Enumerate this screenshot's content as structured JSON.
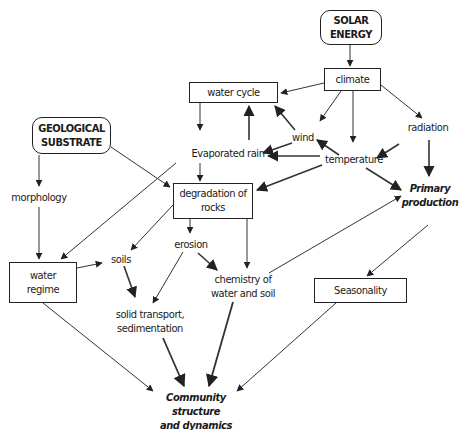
{
  "diagram": {
    "nodes": {
      "solar_energy": {
        "line1": "SOLAR",
        "line2": "ENERGY"
      },
      "climate": {
        "label": "climate"
      },
      "water_cycle": {
        "label": "water cycle"
      },
      "wind": {
        "label": "wind"
      },
      "radiation": {
        "label": "radiation"
      },
      "evaporated_rain": {
        "label": "Evaporated rain"
      },
      "temperature": {
        "label": "temperature"
      },
      "geological_substrate": {
        "line1": "GEOLOGICAL",
        "line2": "SUBSTRATE"
      },
      "morphology": {
        "label": "morphology"
      },
      "degradation_of_rocks": {
        "line1": "degradation of",
        "line2": "rocks"
      },
      "primary_production": {
        "line1": "Primary",
        "line2": "production"
      },
      "erosion": {
        "label": "erosion"
      },
      "soils": {
        "label": "soils"
      },
      "water_regime": {
        "line1": "water",
        "line2": "regime"
      },
      "chemistry": {
        "line1": "chemistry of",
        "line2": "water and soil"
      },
      "seasonality": {
        "label": "Seasonality"
      },
      "solid_transport": {
        "line1": "solid transport,",
        "line2": "sedimentation"
      },
      "community": {
        "line1": "Community structure",
        "line2": "and dynamics"
      }
    },
    "edges": [
      [
        "solar_energy",
        "climate"
      ],
      [
        "climate",
        "water_cycle"
      ],
      [
        "climate",
        "wind"
      ],
      [
        "climate",
        "temperature"
      ],
      [
        "climate",
        "radiation"
      ],
      [
        "water_cycle",
        "evaporated_rain"
      ],
      [
        "evaporated_rain",
        "water_cycle"
      ],
      [
        "wind",
        "water_cycle"
      ],
      [
        "wind",
        "evaporated_rain"
      ],
      [
        "temperature",
        "wind"
      ],
      [
        "temperature",
        "evaporated_rain"
      ],
      [
        "temperature",
        "degradation_of_rocks"
      ],
      [
        "temperature",
        "primary_production"
      ],
      [
        "radiation",
        "temperature"
      ],
      [
        "radiation",
        "primary_production"
      ],
      [
        "geological_substrate",
        "morphology"
      ],
      [
        "geological_substrate",
        "degradation_of_rocks"
      ],
      [
        "evaporated_rain",
        "degradation_of_rocks"
      ],
      [
        "evaporated_rain",
        "water_regime"
      ],
      [
        "morphology",
        "water_regime"
      ],
      [
        "degradation_of_rocks",
        "soils"
      ],
      [
        "degradation_of_rocks",
        "erosion"
      ],
      [
        "degradation_of_rocks",
        "chemistry"
      ],
      [
        "water_regime",
        "soils"
      ],
      [
        "erosion",
        "chemistry"
      ],
      [
        "erosion",
        "solid_transport"
      ],
      [
        "soils",
        "solid_transport"
      ],
      [
        "chemistry",
        "primary_production"
      ],
      [
        "primary_production",
        "seasonality"
      ],
      [
        "water_regime",
        "community"
      ],
      [
        "solid_transport",
        "community"
      ],
      [
        "chemistry",
        "community"
      ],
      [
        "seasonality",
        "community"
      ]
    ],
    "colors": {
      "line": "#333333",
      "thick_line": "#444444",
      "text": "#1a1a1a"
    }
  }
}
